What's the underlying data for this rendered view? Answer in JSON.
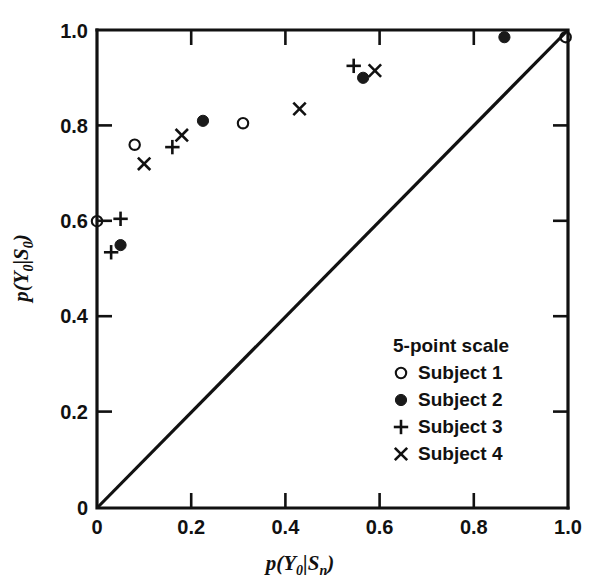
{
  "chart_data": {
    "type": "scatter",
    "title": "",
    "xlabel": "p(Y0|Sn)",
    "ylabel": "p(Y0|S0)",
    "xlim": [
      0.0,
      1.0
    ],
    "ylim": [
      0.0,
      1.0
    ],
    "xticks": [
      "0",
      "0.2",
      "0.4",
      "0.6",
      "0.8",
      "1.0"
    ],
    "xtick_values": [
      0,
      0.2,
      0.4,
      0.6,
      0.8,
      1.0
    ],
    "yticks": [
      "0",
      "0.2",
      "0.4",
      "0.6",
      "0.8",
      "1.0"
    ],
    "ytick_values": [
      0,
      0.2,
      0.4,
      0.6,
      0.8,
      1.0
    ],
    "grid": false,
    "legend_position": "lower-right",
    "legend_title": "5-point scale",
    "reference_line": {
      "name": "diagonal",
      "from": [
        0.0,
        0.0
      ],
      "to": [
        1.0,
        1.0
      ],
      "style": "solid"
    },
    "series": [
      {
        "name": "Subject 1",
        "marker": "open-circle",
        "points": [
          {
            "x": 0.0,
            "y": 0.6
          },
          {
            "x": 0.08,
            "y": 0.76
          },
          {
            "x": 0.31,
            "y": 0.805
          },
          {
            "x": 0.995,
            "y": 0.985
          }
        ]
      },
      {
        "name": "Subject 2",
        "marker": "filled-circle",
        "points": [
          {
            "x": 0.05,
            "y": 0.55
          },
          {
            "x": 0.225,
            "y": 0.81
          },
          {
            "x": 0.565,
            "y": 0.9
          },
          {
            "x": 0.865,
            "y": 0.985
          }
        ]
      },
      {
        "name": "Subject 3",
        "marker": "plus",
        "points": [
          {
            "x": 0.03,
            "y": 0.535
          },
          {
            "x": 0.05,
            "y": 0.605
          },
          {
            "x": 0.16,
            "y": 0.755
          },
          {
            "x": 0.545,
            "y": 0.925
          }
        ]
      },
      {
        "name": "Subject 4",
        "marker": "cross",
        "points": [
          {
            "x": 0.1,
            "y": 0.72
          },
          {
            "x": 0.18,
            "y": 0.78
          },
          {
            "x": 0.43,
            "y": 0.835
          },
          {
            "x": 0.59,
            "y": 0.915
          }
        ]
      }
    ]
  },
  "axes": {
    "x_label_parts": {
      "p": "p",
      "open": "(",
      "Y": "Y",
      "Ysub": "0",
      "bar": "|",
      "S": "S",
      "Ssub": "n",
      "close": ")"
    },
    "y_label_parts": {
      "p": "p",
      "open": "(",
      "Y": "Y",
      "Ysub": "0",
      "bar": "|",
      "S": "S",
      "Ssub": "0",
      "close": ")"
    }
  },
  "legend": {
    "title": "5-point scale",
    "entries": [
      {
        "marker": "open-circle",
        "label": "Subject 1"
      },
      {
        "marker": "filled-circle",
        "label": "Subject 2"
      },
      {
        "marker": "plus",
        "label": "Subject 3"
      },
      {
        "marker": "cross",
        "label": "Subject 4"
      }
    ]
  }
}
